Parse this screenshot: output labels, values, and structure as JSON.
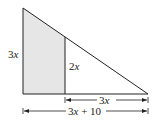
{
  "diagram": {
    "title": "",
    "shaded_region": "left trapezoid under triangle",
    "colors": {
      "stroke": "#222222",
      "shade": "#e6e6e6",
      "background": "#ffffff"
    },
    "labels": {
      "left_height": {
        "coef": "3",
        "var": "x"
      },
      "inner_height": {
        "coef": "2",
        "var": "x"
      },
      "right_segment": {
        "coef": "3",
        "var": "x"
      },
      "base_total": {
        "coef": "3",
        "var": "x",
        "rest": " + 10"
      }
    }
  }
}
